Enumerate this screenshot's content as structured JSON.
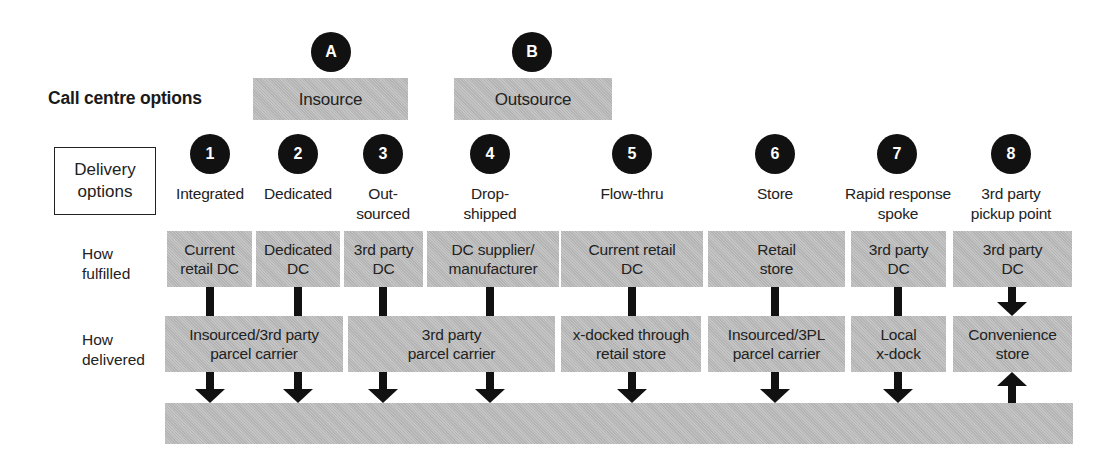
{
  "call_centre": {
    "title": "Call centre options",
    "options": [
      {
        "badge": "A",
        "label": "Insource"
      },
      {
        "badge": "B",
        "label": "Outsource"
      }
    ]
  },
  "delivery": {
    "title": "Delivery\noptions",
    "options": [
      {
        "badge": "1",
        "label": "Integrated"
      },
      {
        "badge": "2",
        "label": "Dedicated"
      },
      {
        "badge": "3",
        "label": "Out-\nsourced"
      },
      {
        "badge": "4",
        "label": "Drop-\nshipped"
      },
      {
        "badge": "5",
        "label": "Flow-thru"
      },
      {
        "badge": "6",
        "label": "Store"
      },
      {
        "badge": "7",
        "label": "Rapid response\nspoke"
      },
      {
        "badge": "8",
        "label": "3rd party\npickup point"
      }
    ]
  },
  "rows": {
    "fulfilled_label": "How\nfulfilled",
    "delivered_label": "How\ndelivered"
  },
  "fulfilled": [
    "Current\nretail DC",
    "Dedicated\nDC",
    "3rd party\nDC",
    "DC supplier/\nmanufacturer",
    "Current retail\nDC",
    "Retail\nstore",
    "3rd party\nDC",
    "3rd party\nDC"
  ],
  "delivered": [
    "Insourced/3rd party\nparcel carrier",
    "3rd party\nparcel carrier",
    "x-docked through\nretail store",
    "Insourced/3PL\nparcel carrier",
    "Local\nx-dock",
    "Convenience\nstore"
  ],
  "colors": {
    "box_fill": "#bdbdbd",
    "badge_fill": "#111111",
    "arrow": "#111111"
  }
}
